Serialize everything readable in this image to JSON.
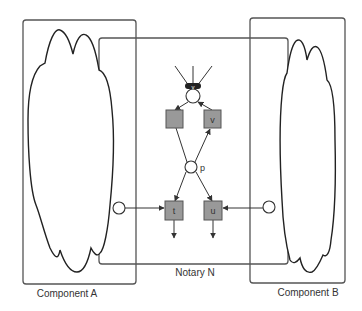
{
  "diagram": {
    "type": "petri-net-components",
    "colors": {
      "stroke": "#555555",
      "cloud_stroke": "#222222",
      "transition_fill": "#999999",
      "place_fill": "#ffffff",
      "text": "#333333"
    },
    "containers": [
      {
        "id": "component-a",
        "label": "Component A"
      },
      {
        "id": "notary-n",
        "label": "Notary N"
      },
      {
        "id": "component-b",
        "label": "Component B"
      }
    ],
    "places": [
      {
        "id": "top-place",
        "label": "",
        "marker": "v"
      },
      {
        "id": "p",
        "label": "p"
      },
      {
        "id": "interface-a",
        "label": ""
      },
      {
        "id": "interface-b",
        "label": ""
      }
    ],
    "transitions": [
      {
        "id": "unnamed",
        "label": ""
      },
      {
        "id": "v",
        "label": "v"
      },
      {
        "id": "t",
        "label": "t"
      },
      {
        "id": "u",
        "label": "u"
      }
    ],
    "arcs": [
      {
        "from": "top-place",
        "to": "unnamed"
      },
      {
        "from": "v",
        "to": "top-place"
      },
      {
        "from": "unnamed",
        "to": "p"
      },
      {
        "from": "p",
        "to": "v"
      },
      {
        "from": "p",
        "to": "t"
      },
      {
        "from": "p",
        "to": "u"
      },
      {
        "from": "interface-a",
        "to": "t"
      },
      {
        "from": "interface-b",
        "to": "u"
      },
      {
        "from": "t",
        "to": "out"
      },
      {
        "from": "u",
        "to": "out"
      }
    ]
  }
}
